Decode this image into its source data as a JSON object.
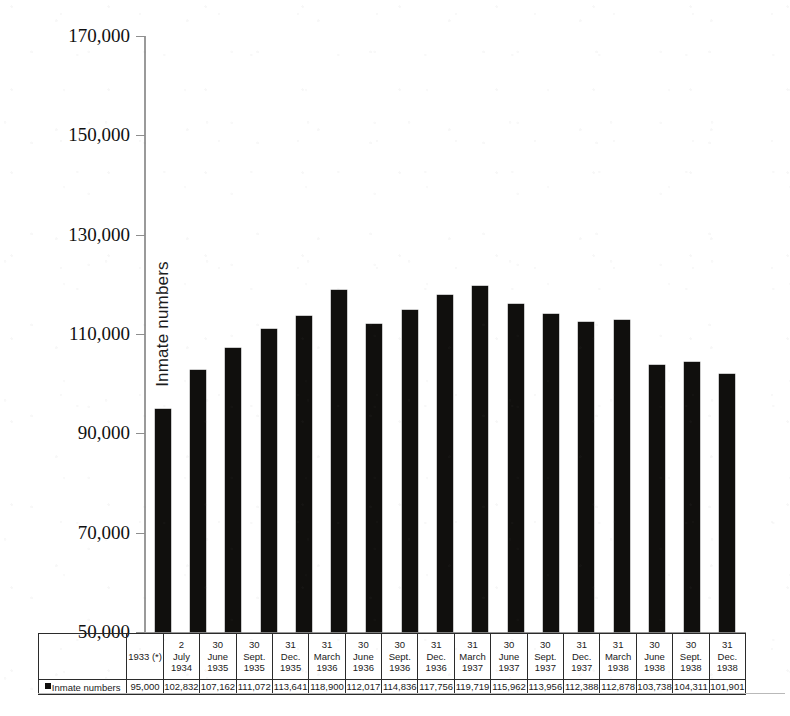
{
  "chart_data": {
    "type": "bar",
    "title": "",
    "xlabel": "",
    "ylabel": "Inmate numbers",
    "ylim": [
      50000,
      170000
    ],
    "ytick_labels": [
      "170,000",
      "150,000",
      "130,000",
      "110,000",
      "90,000",
      "70,000",
      "50,000"
    ],
    "ytick_values": [
      170000,
      150000,
      130000,
      110000,
      90000,
      70000,
      50000
    ],
    "grid": false,
    "legend": [
      "Inmate numbers"
    ],
    "legend_position": "bottom-left",
    "bar_color": "#100f0d",
    "axis_color": "#9a9a9a",
    "categories": [
      "1933 (*)",
      "2 July 1934",
      "30 June 1935",
      "30 Sept. 1935",
      "31 Dec. 1935",
      "31 March 1936",
      "30 June 1936",
      "30 Sept. 1936",
      "31 Dec. 1936",
      "31 March 1937",
      "30 June 1937",
      "30 Sept. 1937",
      "31 Dec. 1937",
      "31 March 1938",
      "30 June 1938",
      "30 Sept. 1938",
      "31 Dec. 1938"
    ],
    "category_lines": [
      [
        "",
        "1933 (*)",
        ""
      ],
      [
        "2",
        "July",
        "1934"
      ],
      [
        "30",
        "June",
        "1935"
      ],
      [
        "30",
        "Sept.",
        "1935"
      ],
      [
        "31",
        "Dec.",
        "1935"
      ],
      [
        "31",
        "March",
        "1936"
      ],
      [
        "30",
        "June",
        "1936"
      ],
      [
        "30",
        "Sept.",
        "1936"
      ],
      [
        "31",
        "Dec.",
        "1936"
      ],
      [
        "31",
        "March",
        "1937"
      ],
      [
        "30",
        "June",
        "1937"
      ],
      [
        "30",
        "Sept.",
        "1937"
      ],
      [
        "31",
        "Dec.",
        "1937"
      ],
      [
        "31",
        "March",
        "1938"
      ],
      [
        "30",
        "June",
        "1938"
      ],
      [
        "30",
        "Sept.",
        "1938"
      ],
      [
        "31",
        "Dec.",
        "1938"
      ]
    ],
    "values": [
      95000,
      102832,
      107162,
      111072,
      113641,
      118900,
      112017,
      114836,
      117756,
      119719,
      115962,
      113956,
      112388,
      112878,
      103738,
      104311,
      101901
    ],
    "value_labels": [
      "95,000",
      "102,832",
      "107,162",
      "111,072",
      "113,641",
      "118,900",
      "112,017",
      "114,836",
      "117,756",
      "119,719",
      "115,962",
      "113,956",
      "112,388",
      "112,878",
      "103,738",
      "104,311",
      "101,901"
    ],
    "series": [
      {
        "name": "Inmate numbers",
        "values": [
          95000,
          102832,
          107162,
          111072,
          113641,
          118900,
          112017,
          114836,
          117756,
          119719,
          115962,
          113956,
          112388,
          112878,
          103738,
          104311,
          101901
        ]
      }
    ]
  },
  "table": {
    "row_label": "Inmate numbers"
  }
}
